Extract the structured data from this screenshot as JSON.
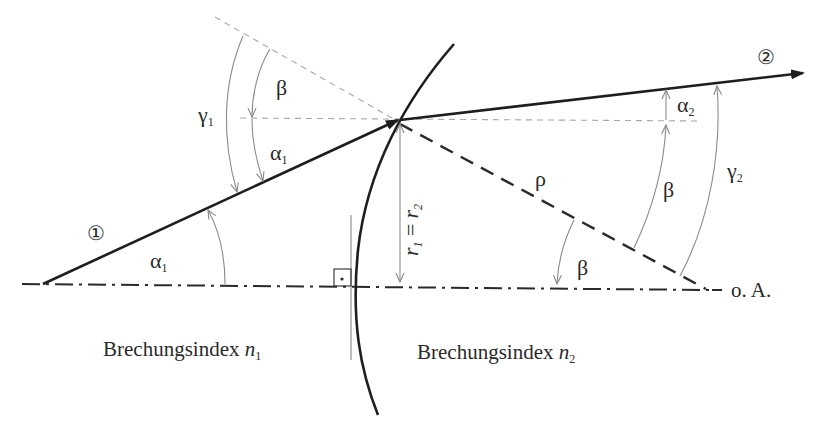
{
  "diagram": {
    "title_hint": "Brechung an einer sphärischen Fläche",
    "rays": {
      "incident_marker": "①",
      "refracted_marker": "②"
    },
    "angles": {
      "alpha1_top": "α",
      "alpha1_top_sub": "1",
      "alpha1_bottom": "α",
      "alpha1_bottom_sub": "1",
      "gamma1": "γ",
      "gamma1_sub": "1",
      "beta_top": "β",
      "beta_center": "β",
      "beta_right": "β",
      "alpha2": "α",
      "alpha2_sub": "2",
      "gamma2": "γ",
      "gamma2_sub": "2",
      "rho": "ρ"
    },
    "height_label": {
      "r1": "r",
      "r1_sub": "1",
      "equals": "=",
      "r2": "r",
      "r2_sub": "2"
    },
    "axis_label": "o. A.",
    "right_angle_marker": "·",
    "media": {
      "left_label": "Brechungsindex ",
      "left_symbol": "n",
      "left_sub": "1",
      "right_label": "Brechungsindex ",
      "right_symbol": "n",
      "right_sub": "2"
    },
    "colors": {
      "ray": "#1e1e1e",
      "construction": "#a8a8a8",
      "arc": "#8a8a8a",
      "background": "#ffffff"
    }
  }
}
